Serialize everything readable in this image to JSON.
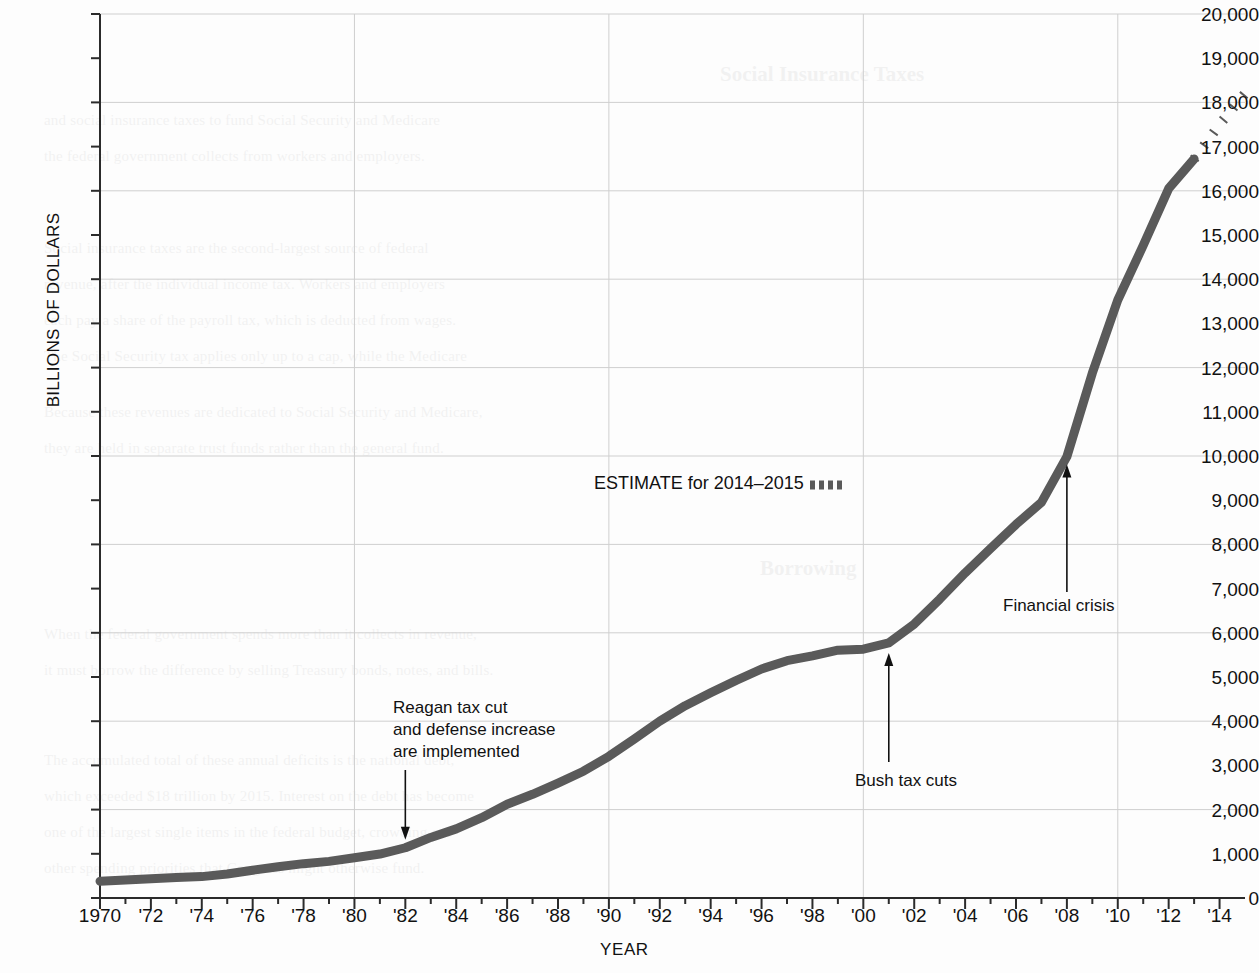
{
  "chart_data": {
    "type": "line",
    "title": "",
    "xlabel": "YEAR",
    "ylabel": "BILLIONS OF DOLLARS",
    "xlim": [
      1970,
      2015
    ],
    "ylim": [
      0,
      20000
    ],
    "grid": true,
    "y_gridline_step": 2000,
    "y_tick_step": 1000,
    "x_tick_step": 1,
    "x_label_step": 2,
    "legend": {
      "position": "inside-center",
      "entries": [
        {
          "label": "ESTIMATE for 2014–2015",
          "style": "dotted",
          "color": "#5a5a5a"
        }
      ]
    },
    "series": [
      {
        "name": "Gross federal debt",
        "style": "solid",
        "color": "#5a5a5a",
        "x": [
          1970,
          1971,
          1972,
          1973,
          1974,
          1975,
          1976,
          1977,
          1978,
          1979,
          1980,
          1981,
          1982,
          1983,
          1984,
          1985,
          1986,
          1987,
          1988,
          1989,
          1990,
          1991,
          1992,
          1993,
          1994,
          1995,
          1996,
          1997,
          1998,
          1999,
          2000,
          2001,
          2002,
          2003,
          2004,
          2005,
          2006,
          2007,
          2008,
          2009,
          2010,
          2011,
          2012,
          2013
        ],
        "values": [
          381,
          408,
          436,
          466,
          484,
          542,
          629,
          706,
          777,
          829,
          909,
          994,
          1137,
          1371,
          1564,
          1817,
          2120,
          2346,
          2601,
          2868,
          3206,
          3598,
          4002,
          4351,
          4643,
          4921,
          5181,
          5369,
          5478,
          5606,
          5629,
          5770,
          6198,
          6760,
          7355,
          7905,
          8451,
          8951,
          9986,
          11876,
          13529,
          14764,
          16051,
          16719
        ]
      },
      {
        "name": "ESTIMATE for 2014-2015",
        "style": "dotted",
        "color": "#5a5a5a",
        "x": [
          2013,
          2014,
          2015
        ],
        "values": [
          16719,
          17500,
          18200
        ]
      }
    ],
    "y_ticks": [
      "0",
      "1,000",
      "2,000",
      "3,000",
      "4,000",
      "5,000",
      "6,000",
      "7,000",
      "8,000",
      "9,000",
      "10,000",
      "11,000",
      "12,000",
      "13,000",
      "14,000",
      "15,000",
      "16,000",
      "17,000",
      "18,000",
      "19,000",
      "20,000"
    ],
    "x_ticks": [
      "1970",
      "'72",
      "'74",
      "'76",
      "'78",
      "'80",
      "'82",
      "'84",
      "'86",
      "'88",
      "'90",
      "'92",
      "'94",
      "'96",
      "'98",
      "'00",
      "'02",
      "'04",
      "'06",
      "'08",
      "'10",
      "'12",
      "'14"
    ],
    "annotations": [
      {
        "id": "reagan",
        "lines": [
          "Reagan tax cut",
          "and defense increase",
          "are implemented"
        ],
        "text": "Reagan tax cut and defense increase are implemented",
        "arrow": "down",
        "point_year": 1982,
        "point_value": 1137
      },
      {
        "id": "bush",
        "lines": [
          "Bush tax cuts"
        ],
        "text": "Bush tax cuts",
        "arrow": "up",
        "point_year": 2001,
        "point_value": 5770
      },
      {
        "id": "financial-crisis",
        "lines": [
          "Financial crisis"
        ],
        "text": "Financial crisis",
        "arrow": "up",
        "point_year": 2008,
        "point_value": 9986
      }
    ]
  },
  "colors": {
    "line": "#5a5a5a",
    "grid": "#cfcfcf",
    "axis": "#2b2b2b",
    "text": "#111111",
    "background": "#fdfdfd"
  },
  "ghost_text": {
    "heading_1": "Social Insurance Taxes",
    "heading_2": "Borrowing",
    "lines": [
      "and social insurance taxes to fund Social Security and Medicare",
      "the federal government collects from workers and employers.",
      "Social insurance taxes are the second-largest source of federal",
      "revenue, after the individual income tax. Workers and employers",
      "each pay a share of the payroll tax, which is deducted from wages.",
      "The Social Security tax applies only up to a cap, while the Medicare",
      "tax applies to all earnings.",
      "Because these revenues are dedicated to Social Security and Medicare,",
      "they are held in separate trust funds rather than the general fund.",
      "When the federal government spends more than it collects in revenue,",
      "it must borrow the difference by selling Treasury bonds, notes, and bills.",
      "The accumulated total of these annual deficits is the national debt,",
      "which exceeded $18 trillion by 2015. Interest on the debt has become",
      "one of the largest single items in the federal budget, crowding out",
      "other spending priorities that Congress might otherwise fund."
    ]
  }
}
